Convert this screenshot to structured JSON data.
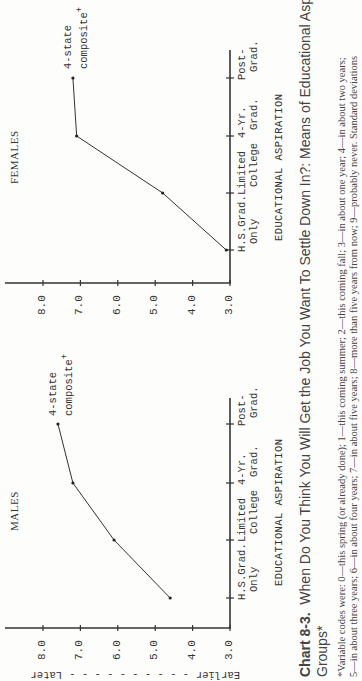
{
  "figure": {
    "caption_label": "Chart 8-3.",
    "caption_text": "When Do You Think You Will Get the Job You Want To Settle Down In?: Means of Educational Aspiration",
    "caption_line2": "Groups*",
    "footnote_line1": "*Variable codes were: 0—this spring (or already done); 1—this coming summer; 2—this coming fall; 3—in about one year; 4—in about two years;",
    "footnote_line2": "5—in about three years; 6—in about four years; 7—in about five years; 8—more than five years from now; 9—probably never. Standard deviations",
    "direction_axis": {
      "later_label": "Later",
      "earlier_label": "Earlier",
      "dashes": "- - - - - - - - - -"
    }
  },
  "panels": [
    {
      "title": "MALES",
      "xlabel": "EDUCATIONAL ASPIRATION",
      "annotation_line1": "4-state",
      "annotation_line2": "composite",
      "annotation_mark": "+"
    },
    {
      "title": "FEMALES",
      "xlabel": "EDUCATIONAL ASPIRATION",
      "annotation_line1": "4-state",
      "annotation_line2": "composite",
      "annotation_mark": "+"
    }
  ],
  "yticks": [
    "8.0",
    "7.0",
    "6.0",
    "5.0",
    "4.0",
    "3.0"
  ],
  "categories": [
    {
      "l1": "H.S.Grad.",
      "l2": "Only"
    },
    {
      "l1": "Limited",
      "l2": "College"
    },
    {
      "l1": "4-Yr.",
      "l2": "Grad."
    },
    {
      "l1": "Post-",
      "l2": "Grad."
    }
  ],
  "chart_data": [
    {
      "type": "line",
      "title": "MALES",
      "categories": [
        "H.S.Grad. Only",
        "Limited College",
        "4-Yr. Grad.",
        "Post-Grad."
      ],
      "series": [
        {
          "name": "4-state composite",
          "values": [
            4.6,
            6.1,
            7.2,
            7.6
          ]
        }
      ],
      "xlabel": "EDUCATIONAL ASPIRATION",
      "ylabel": "Later - - - Earlier",
      "ylim": [
        3.0,
        8.0
      ],
      "yticks": [
        3.0,
        4.0,
        5.0,
        6.0,
        7.0,
        8.0
      ],
      "grid": false
    },
    {
      "type": "line",
      "title": "FEMALES",
      "categories": [
        "H.S.Grad. Only",
        "Limited College",
        "4-Yr. Grad.",
        "Post-Grad."
      ],
      "series": [
        {
          "name": "4-state composite",
          "values": [
            3.1,
            4.8,
            7.1,
            7.2
          ]
        }
      ],
      "xlabel": "EDUCATIONAL ASPIRATION",
      "ylabel": "",
      "ylim": [
        3.0,
        8.0
      ],
      "yticks": [
        3.0,
        4.0,
        5.0,
        6.0,
        7.0,
        8.0
      ],
      "grid": false
    }
  ]
}
